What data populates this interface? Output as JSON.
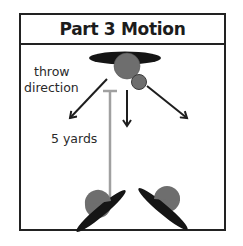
{
  "title": "Part 3 Motion",
  "labels": {
    "throw_line1": "throw",
    "throw_line2": "direction",
    "distance": "5 yards"
  },
  "colors": {
    "frame": "#222222",
    "player_body": "#6e6e6e",
    "player_shadow": "#151515",
    "arrow": "#1e1e1e",
    "distance_marker": "#a0a0a0"
  },
  "elements": {
    "top_player": {
      "role": "thrower",
      "ball": true
    },
    "arrows": [
      "left",
      "center",
      "right"
    ],
    "bottom_players": [
      "left-receiver",
      "right-receiver"
    ]
  }
}
